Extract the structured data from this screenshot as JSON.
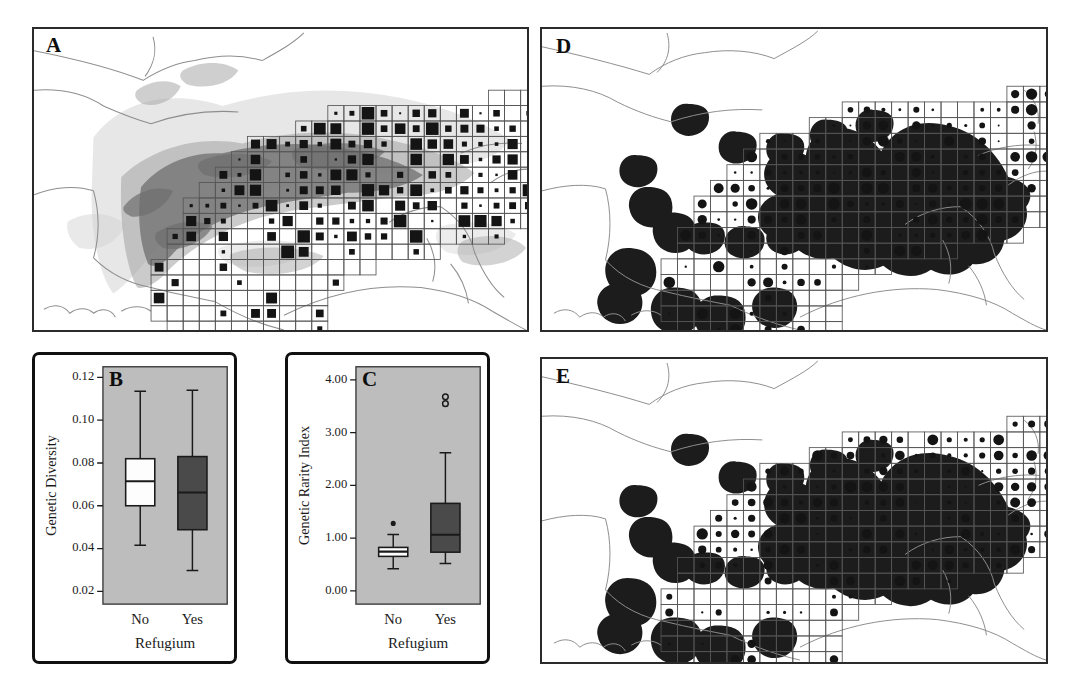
{
  "figure": {
    "width": 1078,
    "height": 691,
    "background": "#ffffff",
    "panel_letters": [
      "A",
      "B",
      "C",
      "D",
      "E"
    ]
  },
  "colors": {
    "frame": "#2b2b2b",
    "box_frame": "#101010",
    "plot_background": "#bdbdbd",
    "box_dark_fill": "#4a4a4a",
    "box_light_fill": "#fdfdfd",
    "refugium_fill": "#1c1c1c",
    "terrain_light": "#d2d2d2",
    "terrain_mid": "#a8a8a8",
    "terrain_dark": "#6e6e6e",
    "coastline": "#8e8e8e",
    "grid_line": "#555555",
    "symbol_fill": "#141414"
  },
  "panels": {
    "A": {
      "letter": "A",
      "type": "map",
      "caption_position": "top-left",
      "description": "Alpine region map with sampling grid; filled squares sized by sample density",
      "symbol_shape": "square",
      "has_terrain_shading": true
    },
    "B": {
      "letter": "B",
      "type": "boxplot",
      "chart_ref": 0
    },
    "C": {
      "letter": "C",
      "type": "boxplot",
      "chart_ref": 1
    },
    "D": {
      "letter": "D",
      "type": "map",
      "caption_position": "top-left",
      "description": "Alpine region map with sampling grid; filled circles sized by genetic diversity; dark areas are glacial refugia",
      "symbol_shape": "circle",
      "has_terrain_shading": false
    },
    "E": {
      "letter": "E",
      "type": "map",
      "caption_position": "top-left",
      "description": "Alpine region map with sampling grid; filled circles sized by genetic rarity index; dark areas are glacial refugia",
      "symbol_shape": "circle",
      "has_terrain_shading": false
    }
  },
  "chart_data": [
    {
      "type": "box",
      "panel": "B",
      "title": "",
      "xlabel": "Refugium",
      "ylabel": "Genetic Diversity",
      "ylim": [
        0.014,
        0.125
      ],
      "yticks": [
        0.02,
        0.04,
        0.06,
        0.08,
        0.1,
        0.12
      ],
      "ytick_labels": [
        "0.02",
        "0.04",
        "0.06",
        "0.08",
        "0.10",
        "0.12"
      ],
      "categories": [
        "No",
        "Yes"
      ],
      "grid": false,
      "legend": "none",
      "boxes": [
        {
          "category": "No",
          "fill": "light",
          "lower_whisker": 0.0415,
          "q1": 0.06,
          "median": 0.0715,
          "q3": 0.082,
          "upper_whisker": 0.1135,
          "outliers": []
        },
        {
          "category": "Yes",
          "fill": "dark",
          "lower_whisker": 0.0297,
          "q1": 0.0488,
          "median": 0.0662,
          "q3": 0.083,
          "upper_whisker": 0.114,
          "outliers": []
        }
      ]
    },
    {
      "type": "box",
      "panel": "C",
      "title": "",
      "xlabel": "Refugium",
      "ylabel": "Genetic Rarity Index",
      "ylim": [
        -0.25,
        4.25
      ],
      "yticks": [
        0.0,
        1.0,
        2.0,
        3.0,
        4.0
      ],
      "ytick_labels": [
        "0.00",
        "1.00",
        "2.00",
        "3.00",
        "4.00"
      ],
      "categories": [
        "No",
        "Yes"
      ],
      "grid": false,
      "legend": "none",
      "boxes": [
        {
          "category": "No",
          "fill": "light",
          "lower_whisker": 0.42,
          "q1": 0.655,
          "median": 0.745,
          "q3": 0.825,
          "upper_whisker": 1.07,
          "outliers": [
            {
              "value": 1.28,
              "style": "filled"
            }
          ]
        },
        {
          "category": "Yes",
          "fill": "dark",
          "lower_whisker": 0.52,
          "q1": 0.735,
          "median": 1.065,
          "q3": 1.66,
          "upper_whisker": 2.62,
          "outliers": [
            {
              "value": 3.55,
              "style": "open"
            },
            {
              "value": 3.68,
              "style": "open"
            }
          ]
        }
      ]
    }
  ]
}
